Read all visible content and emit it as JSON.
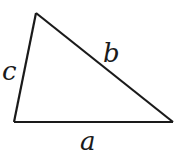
{
  "diagram": {
    "type": "triangle",
    "vertices": {
      "top": [
        36,
        13
      ],
      "bottom_left": [
        14,
        122
      ],
      "bottom_right": [
        173,
        122
      ]
    },
    "sides": [
      {
        "name": "a",
        "label": "a",
        "from": "bottom_left",
        "to": "bottom_right"
      },
      {
        "name": "b",
        "label": "b",
        "from": "top",
        "to": "bottom_right"
      },
      {
        "name": "c",
        "label": "c",
        "from": "bottom_left",
        "to": "top"
      }
    ],
    "stroke_color": "#1a1a1a"
  }
}
